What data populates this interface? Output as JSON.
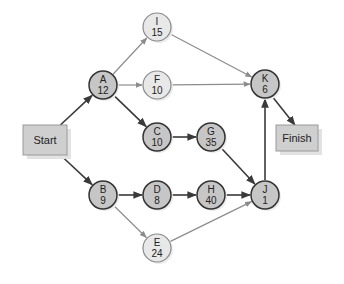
{
  "diagram": {
    "type": "network-critical-path",
    "colors": {
      "critical_fill": "#c6c6c6",
      "critical_stroke": "#333333",
      "noncritical_fill": "#e8e8e8",
      "noncritical_stroke": "#8a8a8a",
      "critical_edge": "#3a3a3a",
      "noncritical_edge": "#8c8c8c",
      "box_fill": "#cfcfcf",
      "box_stroke": "#9a9a9a",
      "shadow": "#e2e2e2"
    },
    "boxes": [
      {
        "id": "start",
        "label": "Start",
        "x": 23,
        "y": 125,
        "w": 44,
        "h": 30
      },
      {
        "id": "finish",
        "label": "Finish",
        "x": 276,
        "y": 125,
        "w": 42,
        "h": 26
      }
    ],
    "nodes": [
      {
        "id": "A",
        "letter": "A",
        "duration": "12",
        "cx": 103,
        "cy": 85,
        "critical": true
      },
      {
        "id": "B",
        "letter": "B",
        "duration": "9",
        "cx": 103,
        "cy": 195,
        "critical": true
      },
      {
        "id": "I",
        "letter": "I",
        "duration": "15",
        "cx": 157,
        "cy": 27,
        "critical": false
      },
      {
        "id": "F",
        "letter": "F",
        "duration": "10",
        "cx": 157,
        "cy": 85,
        "critical": false
      },
      {
        "id": "C",
        "letter": "C",
        "duration": "10",
        "cx": 157,
        "cy": 137,
        "critical": true
      },
      {
        "id": "D",
        "letter": "D",
        "duration": "8",
        "cx": 157,
        "cy": 195,
        "critical": true
      },
      {
        "id": "E",
        "letter": "E",
        "duration": "24",
        "cx": 157,
        "cy": 248,
        "critical": false
      },
      {
        "id": "G",
        "letter": "G",
        "duration": "35",
        "cx": 211,
        "cy": 137,
        "critical": true
      },
      {
        "id": "H",
        "letter": "H",
        "duration": "40",
        "cx": 211,
        "cy": 195,
        "critical": true
      },
      {
        "id": "K",
        "letter": "K",
        "duration": "6",
        "cx": 265,
        "cy": 84,
        "critical": true
      },
      {
        "id": "J",
        "letter": "J",
        "duration": "1",
        "cx": 265,
        "cy": 195,
        "critical": true
      }
    ],
    "edges": [
      {
        "from": "start",
        "to": "A",
        "critical": true
      },
      {
        "from": "start",
        "to": "B",
        "critical": true
      },
      {
        "from": "A",
        "to": "I",
        "critical": false
      },
      {
        "from": "A",
        "to": "F",
        "critical": false
      },
      {
        "from": "A",
        "to": "C",
        "critical": true
      },
      {
        "from": "I",
        "to": "K",
        "critical": false
      },
      {
        "from": "F",
        "to": "K",
        "critical": false
      },
      {
        "from": "C",
        "to": "G",
        "critical": true
      },
      {
        "from": "G",
        "to": "J",
        "critical": true
      },
      {
        "from": "B",
        "to": "D",
        "critical": true
      },
      {
        "from": "B",
        "to": "E",
        "critical": false
      },
      {
        "from": "D",
        "to": "H",
        "critical": true
      },
      {
        "from": "H",
        "to": "J",
        "critical": true
      },
      {
        "from": "E",
        "to": "J",
        "critical": false
      },
      {
        "from": "J",
        "to": "K",
        "critical": true
      },
      {
        "from": "K",
        "to": "finish",
        "critical": true
      }
    ],
    "node_radius": 14
  }
}
